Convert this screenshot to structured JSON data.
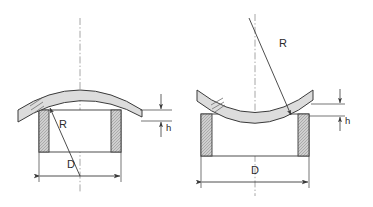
{
  "diagram": {
    "background_color": "#ffffff",
    "line_color": "#3a3a3a",
    "body_fill": "#dcdcdc",
    "hatch_fill": "#c8c8c8",
    "centerline_color": "#8a8a8a",
    "figures": [
      {
        "id": "convex",
        "name": "convex-disc-figure",
        "shape": "convex",
        "labels": {
          "radius": "R",
          "diameter": "D",
          "height": "h"
        }
      },
      {
        "id": "concave",
        "name": "concave-disc-figure",
        "shape": "concave",
        "labels": {
          "radius": "R",
          "diameter": "D",
          "height": "h"
        }
      }
    ]
  }
}
